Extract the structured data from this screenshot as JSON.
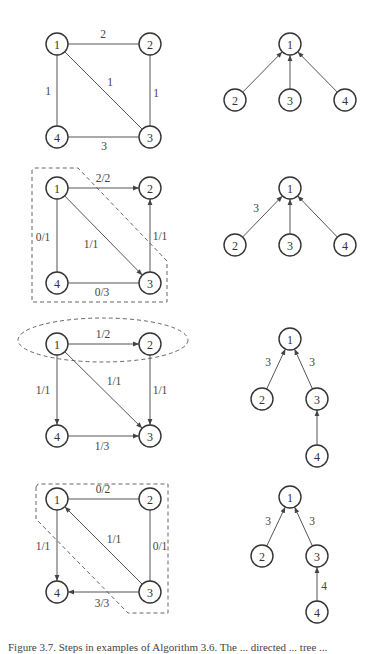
{
  "figure": {
    "node_radius": 11,
    "colors": {
      "stroke": "#333333",
      "edge": "#555555",
      "cut": "#666666",
      "background": "#ffffff"
    },
    "panels": [
      {
        "id": "step0",
        "graph": {
          "nodes": [
            {
              "id": "1",
              "label": "1",
              "x": 57,
              "y": 44
            },
            {
              "id": "2",
              "label": "2",
              "x": 150,
              "y": 44
            },
            {
              "id": "3",
              "label": "3",
              "x": 150,
              "y": 137
            },
            {
              "id": "4",
              "label": "4",
              "x": 57,
              "y": 137
            }
          ],
          "edges": [
            {
              "from": "1",
              "to": "2",
              "label": "2",
              "directed": false,
              "lx": 103,
              "ly": 34
            },
            {
              "from": "1",
              "to": "4",
              "label": "1",
              "directed": false,
              "lx": 48,
              "ly": 91
            },
            {
              "from": "1",
              "to": "3",
              "label": "1",
              "directed": false,
              "lx": 110,
              "ly": 82
            },
            {
              "from": "2",
              "to": "3",
              "label": "1",
              "directed": false,
              "lx": 156,
              "ly": 93
            },
            {
              "from": "4",
              "to": "3",
              "label": "3",
              "directed": false,
              "lx": 104,
              "ly": 146
            }
          ],
          "cut": null
        },
        "tree": {
          "nodes": [
            {
              "id": "1",
              "label": "1",
              "x": 290,
              "y": 44
            },
            {
              "id": "2",
              "label": "2",
              "x": 235,
              "y": 100
            },
            {
              "id": "3",
              "label": "3",
              "x": 290,
              "y": 100
            },
            {
              "id": "4",
              "label": "4",
              "x": 345,
              "y": 100
            }
          ],
          "edges": [
            {
              "from": "2",
              "to": "1",
              "label": ""
            },
            {
              "from": "3",
              "to": "1",
              "label": ""
            },
            {
              "from": "4",
              "to": "1",
              "label": ""
            }
          ]
        }
      },
      {
        "id": "step1",
        "graph": {
          "nodes": [
            {
              "id": "1",
              "label": "1",
              "x": 57,
              "y": 188
            },
            {
              "id": "2",
              "label": "2",
              "x": 150,
              "y": 188
            },
            {
              "id": "3",
              "label": "3",
              "x": 150,
              "y": 283
            },
            {
              "id": "4",
              "label": "4",
              "x": 57,
              "y": 283
            }
          ],
          "edges": [
            {
              "from": "1",
              "to": "2",
              "label": "2/2",
              "directed": true,
              "lx": 103,
              "ly": 178
            },
            {
              "from": "4",
              "to": "1",
              "label": "0/1",
              "directed": false,
              "lx": 43,
              "ly": 237
            },
            {
              "from": "1",
              "to": "3",
              "label": "1/1",
              "directed": true,
              "lx": 91,
              "ly": 244
            },
            {
              "from": "3",
              "to": "2",
              "label": "1/1",
              "directed": true,
              "lx": 160,
              "ly": 236
            },
            {
              "from": "4",
              "to": "3",
              "label": "0/3",
              "directed": false,
              "lx": 102,
              "ly": 292
            }
          ],
          "cut": {
            "type": "polygon",
            "points": "32,170 32,302 167,302 167,261 78,168 34,168"
          }
        },
        "tree": {
          "nodes": [
            {
              "id": "1",
              "label": "1",
              "x": 290,
              "y": 188
            },
            {
              "id": "2",
              "label": "2",
              "x": 235,
              "y": 245
            },
            {
              "id": "3",
              "label": "3",
              "x": 290,
              "y": 245
            },
            {
              "id": "4",
              "label": "4",
              "x": 345,
              "y": 245
            }
          ],
          "edges": [
            {
              "from": "2",
              "to": "1",
              "label": "3",
              "lx": 256,
              "ly": 208
            },
            {
              "from": "3",
              "to": "1",
              "label": ""
            },
            {
              "from": "4",
              "to": "1",
              "label": ""
            }
          ]
        }
      },
      {
        "id": "step2",
        "graph": {
          "nodes": [
            {
              "id": "1",
              "label": "1",
              "x": 57,
              "y": 344
            },
            {
              "id": "2",
              "label": "2",
              "x": 150,
              "y": 344
            },
            {
              "id": "3",
              "label": "3",
              "x": 150,
              "y": 436
            },
            {
              "id": "4",
              "label": "4",
              "x": 57,
              "y": 436
            }
          ],
          "edges": [
            {
              "from": "1",
              "to": "2",
              "label": "1/2",
              "directed": true,
              "lx": 103,
              "ly": 334
            },
            {
              "from": "1",
              "to": "4",
              "label": "1/1",
              "directed": true,
              "lx": 43,
              "ly": 390
            },
            {
              "from": "1",
              "to": "3",
              "label": "1/1",
              "directed": true,
              "lx": 114,
              "ly": 381
            },
            {
              "from": "2",
              "to": "3",
              "label": "1/1",
              "directed": true,
              "lx": 160,
              "ly": 390
            },
            {
              "from": "4",
              "to": "3",
              "label": "1/3",
              "directed": true,
              "lx": 102,
              "ly": 446
            }
          ],
          "cut": {
            "type": "ellipse",
            "cx": 103,
            "cy": 340,
            "rx": 85,
            "ry": 22
          }
        },
        "tree": {
          "nodes": [
            {
              "id": "1",
              "label": "1",
              "x": 290,
              "y": 339
            },
            {
              "id": "2",
              "label": "2",
              "x": 262,
              "y": 399
            },
            {
              "id": "3",
              "label": "3",
              "x": 317,
              "y": 399
            },
            {
              "id": "4",
              "label": "4",
              "x": 317,
              "y": 456
            }
          ],
          "edges": [
            {
              "from": "2",
              "to": "1",
              "label": "3",
              "lx": 268,
              "ly": 362
            },
            {
              "from": "3",
              "to": "1",
              "label": "3",
              "lx": 312,
              "ly": 362
            },
            {
              "from": "4",
              "to": "3",
              "label": ""
            }
          ]
        }
      },
      {
        "id": "step3",
        "graph": {
          "nodes": [
            {
              "id": "1",
              "label": "1",
              "x": 57,
              "y": 499
            },
            {
              "id": "2",
              "label": "2",
              "x": 150,
              "y": 499
            },
            {
              "id": "3",
              "label": "3",
              "x": 150,
              "y": 592
            },
            {
              "id": "4",
              "label": "4",
              "x": 57,
              "y": 592
            }
          ],
          "edges": [
            {
              "from": "1",
              "to": "2",
              "label": "0/2",
              "directed": false,
              "lx": 103,
              "ly": 489
            },
            {
              "from": "1",
              "to": "4",
              "label": "1/1",
              "directed": true,
              "lx": 43,
              "ly": 546
            },
            {
              "from": "3",
              "to": "1",
              "label": "1/1",
              "directed": true,
              "lx": 114,
              "ly": 539
            },
            {
              "from": "2",
              "to": "3",
              "label": "0/1",
              "directed": false,
              "lx": 160,
              "ly": 546
            },
            {
              "from": "3",
              "to": "4",
              "label": "3/3",
              "directed": true,
              "lx": 102,
              "ly": 603
            }
          ],
          "cut": {
            "type": "polygon",
            "points": "36,487 36,519 128,613 168,613 168,484 38,484"
          }
        },
        "tree": {
          "nodes": [
            {
              "id": "1",
              "label": "1",
              "x": 290,
              "y": 497
            },
            {
              "id": "2",
              "label": "2",
              "x": 262,
              "y": 556
            },
            {
              "id": "3",
              "label": "3",
              "x": 317,
              "y": 556
            },
            {
              "id": "4",
              "label": "4",
              "x": 317,
              "y": 612
            }
          ],
          "edges": [
            {
              "from": "2",
              "to": "1",
              "label": "3",
              "lx": 268,
              "ly": 521
            },
            {
              "from": "3",
              "to": "1",
              "label": "3",
              "lx": 312,
              "ly": 521
            },
            {
              "from": "4",
              "to": "3",
              "label": "4",
              "lx": 324,
              "ly": 586
            }
          ]
        }
      }
    ],
    "caption": "Figure 3.7. Steps in examples of Algorithm 3.6. The ... directed ... tree ..."
  }
}
